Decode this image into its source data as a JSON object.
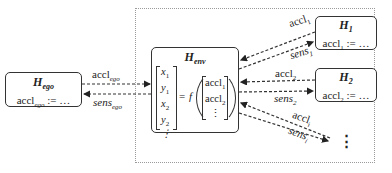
{
  "diagram": {
    "container": {
      "style": "dotted"
    },
    "nodes": {
      "ego": {
        "title_main": "H",
        "title_sub": "ego",
        "body_var": "accl",
        "body_sub": "ego",
        "body_rest": " := …"
      },
      "env": {
        "title_main": "H",
        "title_sub": "env",
        "state_vector": [
          "ẋ1",
          "ẏ1",
          "ẋ2",
          "ẏ2",
          "⋮"
        ],
        "state_vector_display": [
          {
            "v": "x",
            "s": "1"
          },
          {
            "v": "y",
            "s": "1"
          },
          {
            "v": "x",
            "s": "2"
          },
          {
            "v": "y",
            "s": "2"
          },
          {
            "v": "⋮",
            "s": ""
          }
        ],
        "equals": "=",
        "func": "f",
        "input_vector": [
          {
            "v": "accl",
            "s": "1"
          },
          {
            "v": "accl",
            "s": "2"
          },
          {
            "v": "⋮",
            "s": ""
          }
        ]
      },
      "h1": {
        "title_main": "H",
        "title_sub": "1",
        "body_var": "accl",
        "body_sub": "1",
        "body_rest": " := …"
      },
      "h2": {
        "title_main": "H",
        "title_sub": "2",
        "body_var": "accl",
        "body_sub": "2",
        "body_rest": " := …"
      },
      "hi": {
        "ellipsis": "⋮"
      }
    },
    "edges": [
      {
        "from": "ego",
        "to": "env",
        "label_main": "accl",
        "label_sub": "ego",
        "italic": false
      },
      {
        "from": "env",
        "to": "ego",
        "label_main": "sens",
        "label_sub": "ego",
        "italic": true
      },
      {
        "from": "h1",
        "to": "env",
        "label_main": "accl",
        "label_sub": "1",
        "italic": false
      },
      {
        "from": "env",
        "to": "h1",
        "label_main": "sens",
        "label_sub": "1",
        "italic": true
      },
      {
        "from": "h2",
        "to": "env",
        "label_main": "accl",
        "label_sub": "2",
        "italic": false
      },
      {
        "from": "env",
        "to": "h2",
        "label_main": "sens",
        "label_sub": "2",
        "italic": true
      },
      {
        "from": "hi",
        "to": "env",
        "label_main": "accl",
        "label_sub": "i",
        "italic": false
      },
      {
        "from": "env",
        "to": "hi",
        "label_main": "sens",
        "label_sub": "i",
        "italic": true
      }
    ],
    "colors": {
      "stroke": "#333333",
      "container_border": "#9a9a9a",
      "background": "#ffffff"
    }
  }
}
